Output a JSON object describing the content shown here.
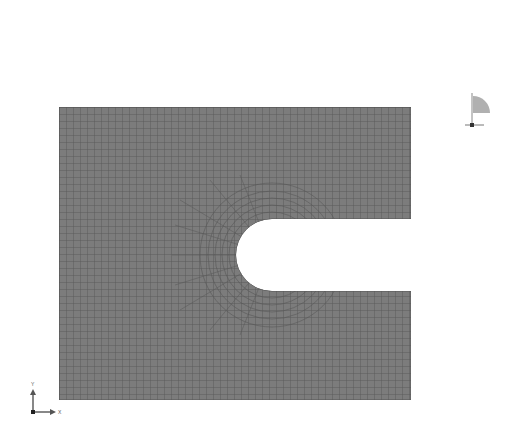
{
  "viewport": {
    "background": "#ffffff",
    "model": {
      "type": "2D plate with U-shaped slot",
      "mesh_fill": "#7c7c7c",
      "mesh_line": "#585858",
      "bounds": {
        "left": 59,
        "top": 107,
        "right": 411,
        "bottom": 400
      },
      "slot": {
        "top": 219,
        "bottom": 291,
        "arc_center_x": 272,
        "radius": 36
      },
      "element_size": 7
    },
    "view_cube_icon": {
      "name": "view-orientation-icon"
    },
    "triad": {
      "x_label": "X",
      "y_label": "Y"
    }
  }
}
